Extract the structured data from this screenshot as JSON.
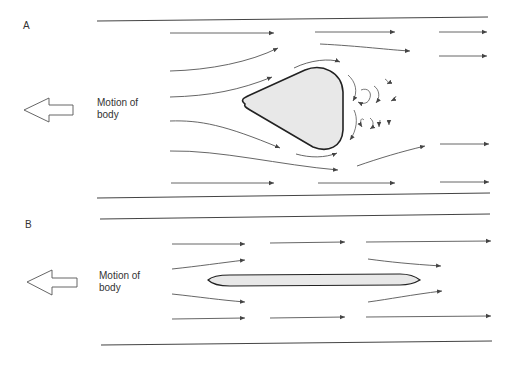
{
  "panels": [
    {
      "id": "A",
      "letter": "A",
      "motion_label_line1": "Motion of",
      "motion_label_line2": "body",
      "body_shape": "rounded-triangle (bluff body)",
      "wake": "turbulent eddies behind body"
    },
    {
      "id": "B",
      "letter": "B",
      "motion_label_line1": "Motion of",
      "motion_label_line2": "body",
      "body_shape": "thin streamlined plate",
      "wake": "smooth flow, no eddies"
    }
  ],
  "colors": {
    "line": "#444444",
    "body_fill": "#e8e8e8",
    "body_stroke": "#222222"
  }
}
